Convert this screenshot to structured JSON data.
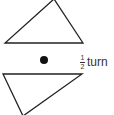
{
  "diagram": {
    "label": {
      "numerator": "1",
      "denominator": "2",
      "text": "turn"
    },
    "colors": {
      "stroke": "#222222",
      "dot": "#111111",
      "text": "#333333"
    }
  }
}
